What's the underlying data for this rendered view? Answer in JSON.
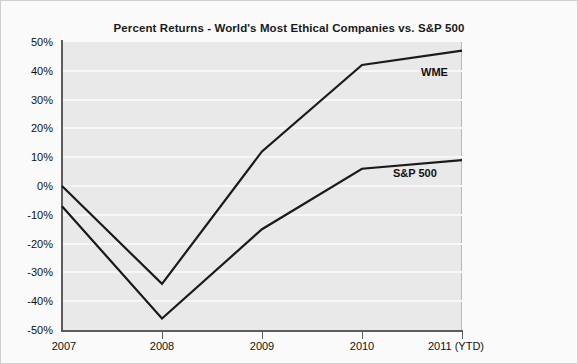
{
  "chart_data": {
    "type": "line",
    "title": "Percent Returns - World's Most Ethical Companies vs. S&P 500",
    "xlabel": "",
    "ylabel": "",
    "categories": [
      "2007",
      "2008",
      "2009",
      "2010",
      "2011 (YTD)"
    ],
    "x_tick_labels": [
      "2007",
      "2008",
      "2009",
      "2010",
      "2011 (YTD)"
    ],
    "y_tick_labels": [
      "50%",
      "40%",
      "30%",
      "20%",
      "10%",
      "0%",
      "-10%",
      "-20%",
      "-30%",
      "-40%",
      "-50%"
    ],
    "y_tick_values": [
      50,
      40,
      30,
      20,
      10,
      0,
      -10,
      -20,
      -30,
      -40,
      -50
    ],
    "ylim": [
      -50,
      50
    ],
    "grid": true,
    "legend_position": "inline-right",
    "series": [
      {
        "name": "WME",
        "label": "WME",
        "values": [
          0,
          -34,
          12,
          42,
          47
        ],
        "color": "#1a1a1a"
      },
      {
        "name": "S&P 500",
        "label": "S&P 500",
        "values": [
          -7,
          -46,
          -15,
          6,
          9
        ],
        "color": "#1a1a1a"
      }
    ],
    "colors": {
      "plot_background": "#e9e9e9",
      "figure_background": "#fafafa",
      "gridline": "#f7f7f7",
      "axis": "#5c5c5c",
      "line": "#1a1a1a",
      "text": "#111111"
    }
  }
}
